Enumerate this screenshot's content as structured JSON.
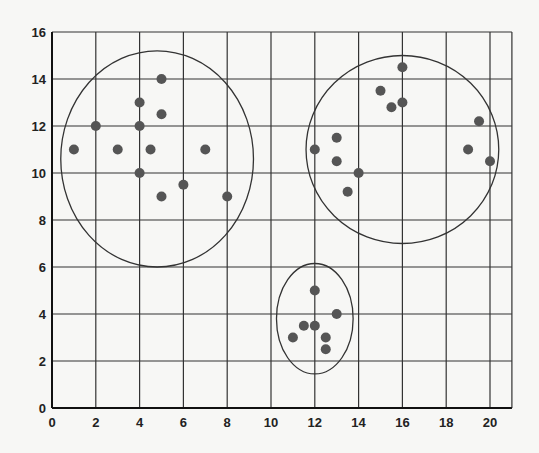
{
  "chart_data": {
    "type": "scatter",
    "title": "",
    "xlabel": "",
    "ylabel": "",
    "xlim": [
      0,
      21
    ],
    "ylim": [
      0,
      16
    ],
    "grid": true,
    "x_ticks": [
      0,
      2,
      4,
      6,
      8,
      10,
      12,
      14,
      16,
      18,
      20
    ],
    "y_ticks": [
      0,
      2,
      4,
      6,
      8,
      10,
      12,
      14,
      16
    ],
    "colors": {
      "point": "#555555",
      "grid": "#333333",
      "ellipse": "#333333",
      "background": "#f7f7f5"
    },
    "series": [
      {
        "name": "Cluster 1",
        "points": [
          [
            1,
            11
          ],
          [
            2,
            12
          ],
          [
            3,
            11
          ],
          [
            4,
            13
          ],
          [
            4,
            12
          ],
          [
            4,
            10
          ],
          [
            4.5,
            11
          ],
          [
            5,
            14
          ],
          [
            5,
            12.5
          ],
          [
            5,
            9
          ],
          [
            6,
            9.5
          ],
          [
            7,
            11
          ],
          [
            8,
            9
          ]
        ],
        "ellipse": {
          "cx": 4.8,
          "cy": 10.6,
          "rx": 4.4,
          "ry": 4.6
        }
      },
      {
        "name": "Cluster 2",
        "points": [
          [
            12,
            11
          ],
          [
            13,
            11.5
          ],
          [
            13,
            10.5
          ],
          [
            13.5,
            9.2
          ],
          [
            14,
            10
          ],
          [
            15,
            13.5
          ],
          [
            15.5,
            12.8
          ],
          [
            16,
            14.5
          ],
          [
            16,
            13
          ],
          [
            19,
            11
          ],
          [
            19.5,
            12.2
          ],
          [
            20,
            10.5
          ]
        ],
        "ellipse": {
          "cx": 16,
          "cy": 11,
          "rx": 4.4,
          "ry": 4
        }
      },
      {
        "name": "Cluster 3",
        "points": [
          [
            12,
            5
          ],
          [
            13,
            4
          ],
          [
            11.5,
            3.5
          ],
          [
            12,
            3.5
          ],
          [
            11,
            3
          ],
          [
            12.5,
            3
          ],
          [
            12.5,
            2.5
          ]
        ],
        "ellipse": {
          "cx": 12,
          "cy": 3.8,
          "rx": 1.75,
          "ry": 2.35
        }
      }
    ]
  }
}
